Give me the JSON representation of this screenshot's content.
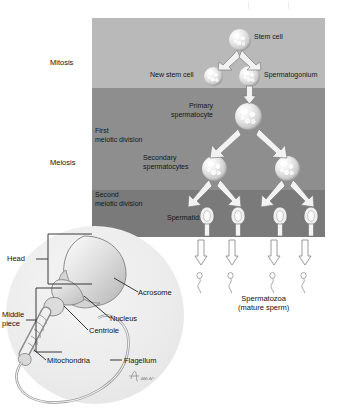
{
  "figure": {
    "type": "biological-process-diagram"
  },
  "phases": {
    "mitosis_label": "Mitosis",
    "meiosis_label": "Meiosis",
    "first_division_label": "First\nmeiotic division",
    "second_division_label": "Second\nmeiotic division"
  },
  "colors": {
    "band_mitosis": "#b9b9b9",
    "band_first_meiotic": "#8e8e8e",
    "band_second_meiotic": "#7a7a7a",
    "detail_disc": "#ececec",
    "text": "#161616",
    "arrow_fill": "#f2f2f2",
    "arrow_stroke": "#6e6e6e"
  },
  "stages": {
    "stem_cell": "Stem cell",
    "new_stem_cell": "New stem cell",
    "spermatogonium": "Spermatogonium",
    "primary_spermatocyte": "Primary\nspermatocyte",
    "secondary_spermatocytes": "Secondary\nspermatocytes",
    "spermatids": "Spermatids",
    "spermatozoa": "Spermatozoa\n(mature sperm)"
  },
  "counts": {
    "stem_cell": 1,
    "new_stem_cell": 1,
    "spermatogonium": 1,
    "primary_spermatocyte": 1,
    "secondary_spermatocytes": 2,
    "spermatids": 4,
    "spermatozoa": 4
  },
  "sperm_anatomy": {
    "head": "Head",
    "middle_piece": "Middle\npiece",
    "acrosome": "Acrosome",
    "nucleus": "Nucleus",
    "centriole": "Centriole",
    "mitochondria": "Mitochondria",
    "flagellum": "Flagellum"
  }
}
